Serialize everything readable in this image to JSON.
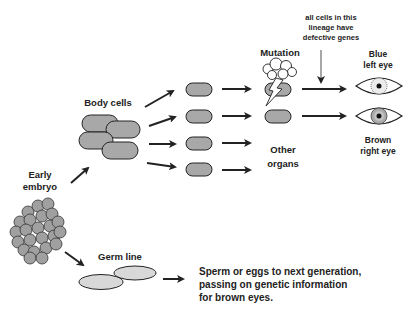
{
  "diagram": {
    "labels": {
      "early_embryo_1": "Early",
      "early_embryo_2": "embryo",
      "body_cells": "Body cells",
      "germ_line": "Germ line",
      "mutation": "Mutation",
      "annotation_1": "all cells in this",
      "annotation_2": "lineage have",
      "annotation_3": "defective genes",
      "blue_eye_1": "Blue",
      "blue_eye_2": "left eye",
      "brown_eye_1": "Brown",
      "brown_eye_2": "right eye",
      "other_organs_1": "Other",
      "other_organs_2": "organs",
      "sperm_1": "Sperm or eggs to next generation,",
      "sperm_2": "passing on genetic information",
      "sperm_3": "for brown eyes."
    },
    "colors": {
      "cell_fill": "#a8a8a8",
      "germ_fill": "#d8d8d8",
      "stroke": "#222222",
      "cloud_fill": "#ffffff",
      "blue_iris": "#e8e8e8",
      "brown_iris": "#b0b0b0"
    }
  }
}
